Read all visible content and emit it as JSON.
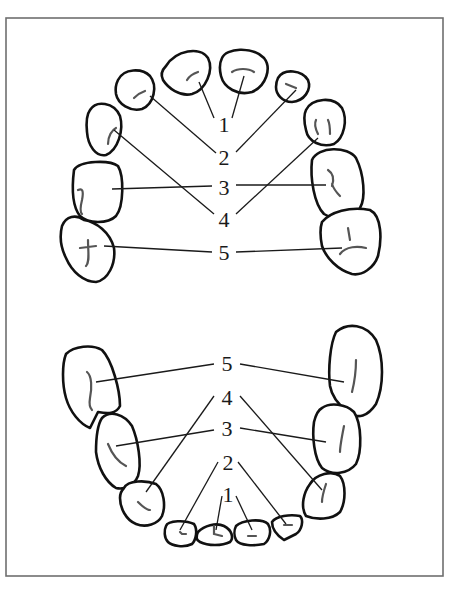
{
  "figure": {
    "type": "dental-arch-diagram",
    "frame": {
      "x": 6,
      "y": 18,
      "w": 437,
      "h": 558
    },
    "upper_arch": {
      "labels": [
        {
          "id": "u1",
          "text": "1",
          "x": 224,
          "y": 124
        },
        {
          "id": "u2",
          "text": "2",
          "x": 224,
          "y": 157
        },
        {
          "id": "u3",
          "text": "3",
          "x": 224,
          "y": 187
        },
        {
          "id": "u4",
          "text": "4",
          "x": 224,
          "y": 219
        },
        {
          "id": "u5",
          "text": "5",
          "x": 224,
          "y": 252
        }
      ],
      "teeth": [
        {
          "id": "upper-central-incisor-left",
          "number": "1"
        },
        {
          "id": "upper-central-incisor-right",
          "number": "1"
        },
        {
          "id": "upper-lateral-incisor-left",
          "number": "2"
        },
        {
          "id": "upper-lateral-incisor-right",
          "number": "2"
        },
        {
          "id": "upper-canine-left",
          "number": "4"
        },
        {
          "id": "upper-canine-right",
          "number": "4"
        },
        {
          "id": "upper-first-molar-left",
          "number": "3"
        },
        {
          "id": "upper-first-molar-right",
          "number": "3"
        },
        {
          "id": "upper-second-molar-left",
          "number": "5"
        },
        {
          "id": "upper-second-molar-right",
          "number": "5"
        }
      ]
    },
    "lower_arch": {
      "labels": [
        {
          "id": "l5",
          "text": "5",
          "x": 227,
          "y": 363
        },
        {
          "id": "l4",
          "text": "4",
          "x": 227,
          "y": 397
        },
        {
          "id": "l3",
          "text": "3",
          "x": 227,
          "y": 428
        },
        {
          "id": "l2",
          "text": "2",
          "x": 228,
          "y": 462
        },
        {
          "id": "l1",
          "text": "1",
          "x": 228,
          "y": 494
        }
      ],
      "teeth": [
        {
          "id": "lower-central-incisor-left",
          "number": "1"
        },
        {
          "id": "lower-central-incisor-right",
          "number": "1"
        },
        {
          "id": "lower-lateral-incisor-left",
          "number": "2"
        },
        {
          "id": "lower-lateral-incisor-right",
          "number": "2"
        },
        {
          "id": "lower-canine-left",
          "number": "4"
        },
        {
          "id": "lower-canine-right",
          "number": "4"
        },
        {
          "id": "lower-first-molar-left",
          "number": "3"
        },
        {
          "id": "lower-first-molar-right",
          "number": "3"
        },
        {
          "id": "lower-second-molar-left",
          "number": "5"
        },
        {
          "id": "lower-second-molar-right",
          "number": "5"
        }
      ]
    }
  }
}
